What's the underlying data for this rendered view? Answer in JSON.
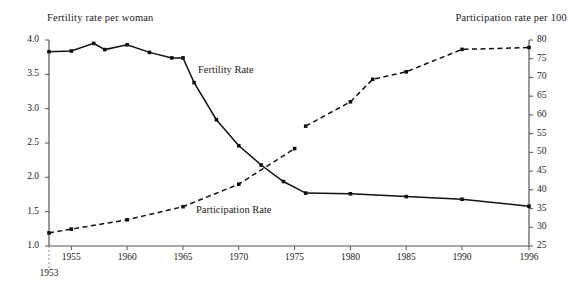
{
  "chart_data": {
    "type": "line",
    "title": "",
    "left_axis": {
      "label": "Fertility rate per woman",
      "ticks": [
        "4.0",
        "3.5",
        "3.0",
        "2.5",
        "2.0",
        "1.5",
        "1.0"
      ],
      "min": 1.0,
      "max": 4.0
    },
    "right_axis": {
      "label": "Participation rate per 100",
      "ticks": [
        "80",
        "75",
        "70",
        "65",
        "60",
        "55",
        "50",
        "45",
        "40",
        "35",
        "30",
        "25"
      ],
      "min": 25,
      "max": 80
    },
    "xlabel": "",
    "x_tick_labels": [
      "1953",
      "1955",
      "1960",
      "1965",
      "1970",
      "1975",
      "1980",
      "1985",
      "1990",
      "1996"
    ],
    "x_ticks": [
      1953,
      1955,
      1960,
      1965,
      1970,
      1975,
      1980,
      1985,
      1990,
      1996
    ],
    "xlim": [
      1953,
      1996
    ],
    "grid": false,
    "legend_position": "inline-annotations",
    "series": [
      {
        "name": "Fertility Rate",
        "axis": "left",
        "style": "solid",
        "annotation": "Fertility Rate",
        "x": [
          1953,
          1955,
          1957,
          1958,
          1960,
          1962,
          1964,
          1965,
          1966,
          1968,
          1970,
          1972,
          1974,
          1976,
          1980,
          1985,
          1990,
          1996
        ],
        "values": [
          3.83,
          3.84,
          3.95,
          3.86,
          3.93,
          3.82,
          3.74,
          3.74,
          3.38,
          2.84,
          2.46,
          2.18,
          1.94,
          1.77,
          1.76,
          1.72,
          1.68,
          1.58
        ]
      },
      {
        "name": "Participation Rate",
        "axis": "right",
        "style": "dashed",
        "annotation": "Participation Rate",
        "segments": [
          {
            "x": [
              1953,
              1955,
              1960,
              1965,
              1970,
              1975
            ],
            "values": [
              28.5,
              29.5,
              32.0,
              35.5,
              41.5,
              51.0
            ]
          },
          {
            "x": [
              1976,
              1980,
              1982,
              1985,
              1990,
              1996
            ],
            "values": [
              57.0,
              63.5,
              69.5,
              71.5,
              77.5,
              78.0
            ]
          }
        ]
      }
    ]
  },
  "annotations": {
    "fertility": "Fertility Rate",
    "participation": "Participation Rate"
  }
}
